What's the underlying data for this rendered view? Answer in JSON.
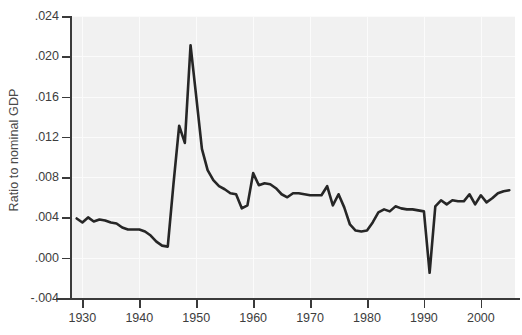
{
  "chart_data": {
    "type": "line",
    "title": "",
    "subtitle": "",
    "xlabel": "",
    "ylabel": "Ratio to nominal GDP",
    "xlim": [
      1928,
      2006
    ],
    "ylim": [
      -0.004,
      0.024
    ],
    "grid": true,
    "legend": null,
    "ytick_labels": [
      ".024",
      ".020",
      ".016",
      ".012",
      ".008",
      ".004",
      ".000",
      "-.004"
    ],
    "ytick_values": [
      0.024,
      0.02,
      0.016,
      0.012,
      0.008,
      0.004,
      0.0,
      -0.004
    ],
    "xtick_labels": [
      "1930",
      "1940",
      "1950",
      "1960",
      "1970",
      "1980",
      "1990",
      "2000"
    ],
    "xtick_values": [
      1930,
      1940,
      1950,
      1960,
      1970,
      1980,
      1990,
      2000
    ],
    "series": [
      {
        "name": "Ratio to nominal GDP",
        "color": "#262626",
        "x": [
          1929,
          1930,
          1931,
          1932,
          1933,
          1934,
          1935,
          1936,
          1937,
          1938,
          1939,
          1940,
          1941,
          1942,
          1943,
          1944,
          1945,
          1946,
          1947,
          1948,
          1949,
          1950,
          1951,
          1952,
          1953,
          1954,
          1955,
          1956,
          1957,
          1958,
          1959,
          1960,
          1961,
          1962,
          1963,
          1964,
          1965,
          1966,
          1967,
          1968,
          1969,
          1970,
          1971,
          1972,
          1973,
          1974,
          1975,
          1976,
          1977,
          1978,
          1979,
          1980,
          1981,
          1982,
          1983,
          1984,
          1985,
          1986,
          1987,
          1988,
          1989,
          1990,
          1991,
          1992,
          1993,
          1994,
          1995,
          1996,
          1997,
          1998,
          1999,
          2000,
          2001,
          2002,
          2003,
          2004,
          2005
        ],
        "y": [
          0.0039,
          0.0035,
          0.004,
          0.0036,
          0.0038,
          0.0037,
          0.0035,
          0.0034,
          0.003,
          0.0028,
          0.0028,
          0.0028,
          0.0026,
          0.0022,
          0.0016,
          0.0012,
          0.0011,
          0.0073,
          0.0131,
          0.0114,
          0.0211,
          0.016,
          0.0108,
          0.0087,
          0.0077,
          0.0071,
          0.0068,
          0.0064,
          0.0063,
          0.0049,
          0.0052,
          0.0084,
          0.0072,
          0.0074,
          0.0073,
          0.0069,
          0.0063,
          0.006,
          0.0064,
          0.0064,
          0.0063,
          0.0062,
          0.0062,
          0.0062,
          0.0071,
          0.0052,
          0.0063,
          0.005,
          0.0033,
          0.0027,
          0.0026,
          0.0027,
          0.0035,
          0.0045,
          0.0048,
          0.0046,
          0.0051,
          0.0049,
          0.0048,
          0.0048,
          0.0047,
          0.0046,
          -0.0015,
          0.0051,
          0.0057,
          0.0053,
          0.0057,
          0.0056,
          0.0056,
          0.0063,
          0.0053,
          0.0062,
          0.0055,
          0.0059,
          0.0064,
          0.0066,
          0.0067
        ]
      }
    ],
    "annotations": [
      {
        "label": "WWII/postwar peak",
        "x": 1949,
        "y": 0.0211
      },
      {
        "label": "1991 trough",
        "x": 1991,
        "y": -0.0015
      }
    ]
  }
}
